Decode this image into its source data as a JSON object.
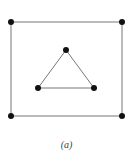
{
  "figure": {
    "caption": "(a)",
    "colors": {
      "edge": "#777777",
      "node": "#111111",
      "background": "#ffffff"
    },
    "outer_square": {
      "nodes": [
        {
          "id": "tl",
          "x": 11,
          "y": 22
        },
        {
          "id": "tr",
          "x": 122,
          "y": 22
        },
        {
          "id": "br",
          "x": 122,
          "y": 116
        },
        {
          "id": "bl",
          "x": 11,
          "y": 116
        }
      ],
      "edges": [
        [
          "tl",
          "tr"
        ],
        [
          "tr",
          "br"
        ],
        [
          "br",
          "bl"
        ],
        [
          "bl",
          "tl"
        ]
      ]
    },
    "inner_triangle": {
      "nodes": [
        {
          "id": "top",
          "x": 66,
          "y": 50
        },
        {
          "id": "left",
          "x": 38,
          "y": 88
        },
        {
          "id": "right",
          "x": 94,
          "y": 88
        }
      ],
      "edges": [
        [
          "top",
          "left"
        ],
        [
          "left",
          "right"
        ],
        [
          "right",
          "top"
        ]
      ]
    }
  }
}
